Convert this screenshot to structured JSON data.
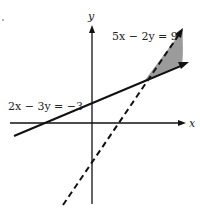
{
  "diagram": {
    "type": "linear-inequality-graph",
    "axes": {
      "x_label": "x",
      "y_label": "y"
    },
    "lines": [
      {
        "equation": "5x − 2y = 9",
        "style": "dashed",
        "color": "#111111"
      },
      {
        "equation": "2x − 3y = −3",
        "style": "solid",
        "color": "#111111"
      }
    ],
    "shaded_region": {
      "color": "#8a8a8a",
      "description": "region above solid line and left of dashed line, beyond their intersection"
    },
    "labels": {
      "dashed_line": "5x − 2y = 9",
      "solid_line": "2x − 3y = −3"
    }
  }
}
